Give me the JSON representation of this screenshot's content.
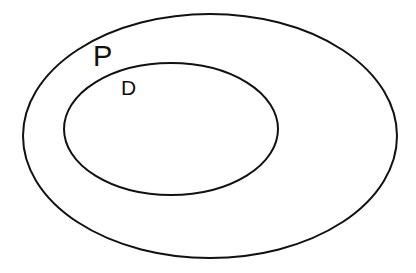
{
  "diagram": {
    "type": "nested-sets",
    "background": "#ffffff",
    "stroke_color": "#111111",
    "sets": [
      {
        "id": "outer",
        "label": "P",
        "ellipse": {
          "cx": 210,
          "cy": 136,
          "rx": 187,
          "ry": 122
        },
        "label_pos": {
          "x": 93,
          "y": 66
        },
        "label_size": 29
      },
      {
        "id": "inner",
        "label": "D",
        "ellipse": {
          "cx": 171,
          "cy": 129,
          "rx": 107,
          "ry": 66
        },
        "label_pos": {
          "x": 121,
          "y": 95
        },
        "label_size": 21
      }
    ],
    "relation": "D is a subset of P"
  }
}
